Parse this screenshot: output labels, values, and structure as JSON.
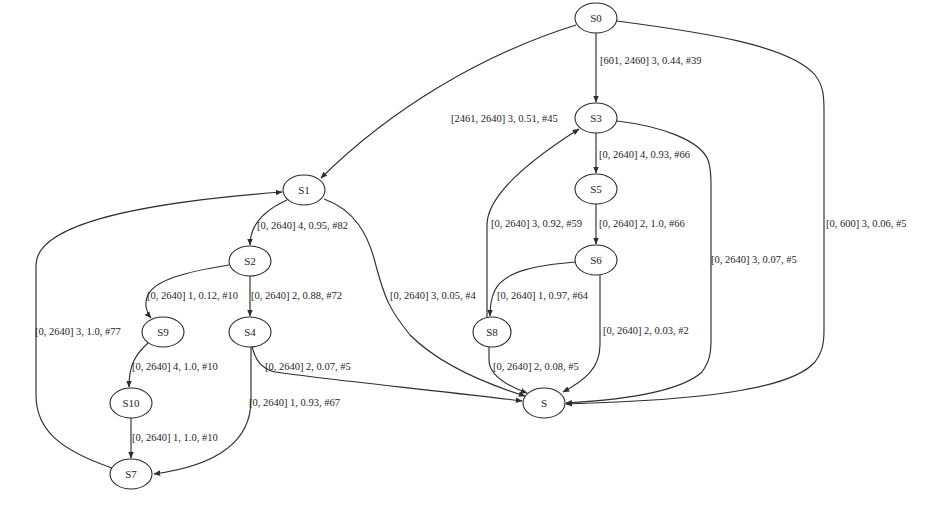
{
  "diagram": {
    "type": "state-transition-graph",
    "nodes": [
      {
        "id": "S0",
        "label": "S0",
        "cx": 596,
        "cy": 18
      },
      {
        "id": "S3",
        "label": "S3",
        "cx": 596,
        "cy": 118
      },
      {
        "id": "S1",
        "label": "S1",
        "cx": 304,
        "cy": 190
      },
      {
        "id": "S5",
        "label": "S5",
        "cx": 596,
        "cy": 189
      },
      {
        "id": "S2",
        "label": "S2",
        "cx": 250,
        "cy": 261
      },
      {
        "id": "S6",
        "label": "S6",
        "cx": 596,
        "cy": 260
      },
      {
        "id": "S9",
        "label": "S9",
        "cx": 163,
        "cy": 332
      },
      {
        "id": "S4",
        "label": "S4",
        "cx": 250,
        "cy": 332
      },
      {
        "id": "S8",
        "label": "S8",
        "cx": 492,
        "cy": 332
      },
      {
        "id": "S10",
        "label": "S10",
        "cx": 131,
        "cy": 403
      },
      {
        "id": "S",
        "label": "S",
        "cx": 544,
        "cy": 403
      },
      {
        "id": "S7",
        "label": "S7",
        "cx": 131,
        "cy": 474
      }
    ],
    "edges": [
      {
        "from": "S0",
        "to": "S3",
        "label": "[601, 2460] 3, 0.44, #39",
        "lx": 600,
        "ly": 61
      },
      {
        "from": "S0",
        "to": "S1",
        "label": "[2461, 2640] 3, 0.51, #45",
        "lx": 450,
        "ly": 121
      },
      {
        "from": "S0",
        "to": "S",
        "label": "[0, 600] 3, 0.06, #5",
        "lx": 825,
        "ly": 224
      },
      {
        "from": "S3",
        "to": "S5",
        "label": "[0, 2640] 4, 0.93, #66",
        "lx": 595,
        "ly": 155
      },
      {
        "from": "S3",
        "to": "S",
        "label": "[0, 2640] 3, 0.07, #5",
        "lx": 710,
        "ly": 260
      },
      {
        "from": "S5",
        "to": "S6",
        "label": "[0, 2640] 2, 1.0, #66",
        "lx": 595,
        "ly": 224
      },
      {
        "from": "S8",
        "to": "S3",
        "label": "[0, 2640] 3, 0.92, #59",
        "lx": 493,
        "ly": 224
      },
      {
        "from": "S6",
        "to": "S8",
        "label": "[0, 2640] 1, 0.97, #64",
        "lx": 497,
        "ly": 296
      },
      {
        "from": "S6",
        "to": "S",
        "label": "[0, 2640] 2, 0.03, #2",
        "lx": 602,
        "ly": 331
      },
      {
        "from": "S8",
        "to": "S",
        "label": "[0, 2640] 2, 0.08, #5",
        "lx": 492,
        "ly": 367
      },
      {
        "from": "S1",
        "to": "S2",
        "label": "[0, 2640] 4, 0.95, #82",
        "lx": 257,
        "ly": 226
      },
      {
        "from": "S1",
        "to": "S",
        "label": "[0, 2640] 3, 0.05, #4",
        "lx": 389,
        "ly": 296
      },
      {
        "from": "S2",
        "to": "S9",
        "label": "[0, 2640] 1, 0.12, #10",
        "lx": 147,
        "ly": 296
      },
      {
        "from": "S2",
        "to": "S4",
        "label": "[0, 2640] 2, 0.88, #72",
        "lx": 251,
        "ly": 296
      },
      {
        "from": "S4",
        "to": "S",
        "label": "[0, 2640] 2, 0.07, #5",
        "lx": 264,
        "ly": 367
      },
      {
        "from": "S4",
        "to": "S7",
        "label": "[0, 2640] 1, 0.93, #67",
        "lx": 249,
        "ly": 403
      },
      {
        "from": "S9",
        "to": "S10",
        "label": "[0, 2640] 4, 1.0, #10",
        "lx": 131,
        "ly": 367
      },
      {
        "from": "S10",
        "to": "S7",
        "label": "[0, 2640] 1, 1.0, #10",
        "lx": 131,
        "ly": 438
      },
      {
        "from": "S7",
        "to": "S1",
        "label": "[0, 2640] 3, 1.0, #77",
        "lx": 34,
        "ly": 332
      }
    ]
  }
}
